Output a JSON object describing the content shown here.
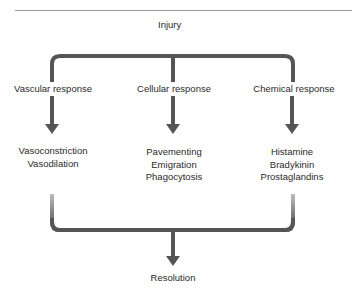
{
  "diagram": {
    "root": "Injury",
    "branches": [
      {
        "label": "Vascular response",
        "items": [
          "Vasoconstriction",
          "Vasodilation"
        ]
      },
      {
        "label": "Cellular response",
        "items": [
          "Pavementing",
          "Emigration",
          "Phagocytosis"
        ]
      },
      {
        "label": "Chemical response",
        "items": [
          "Histamine",
          "Bradykinin",
          "Prostaglandins"
        ]
      }
    ],
    "outcome": "Resolution",
    "colors": {
      "connector": "#555555",
      "text": "#2a2a2a",
      "rule": "#9a9a9a"
    }
  }
}
